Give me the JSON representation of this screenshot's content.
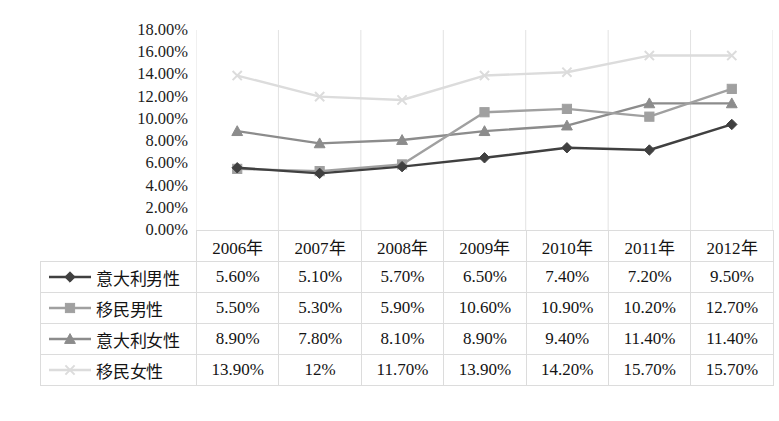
{
  "chart_data": {
    "type": "line",
    "title": "",
    "xlabel": "",
    "ylabel": "",
    "categories": [
      "2006年",
      "2007年",
      "2008年",
      "2009年",
      "2010年",
      "2011年",
      "2012年"
    ],
    "ylim": [
      0,
      18
    ],
    "ytick_step": 2,
    "ytick_labels": [
      "18.00%",
      "16.00%",
      "14.00%",
      "12.00%",
      "10.00%",
      "8.00%",
      "6.00%",
      "4.00%",
      "2.00%",
      "0.00%"
    ],
    "ytick_values": [
      18,
      16,
      14,
      12,
      10,
      8,
      6,
      4,
      2,
      0
    ],
    "grid": "vertical",
    "legend_position": "table-left",
    "series": [
      {
        "name": "意大利男性",
        "marker": "diamond",
        "color": "#404040",
        "values": [
          5.6,
          5.1,
          5.7,
          6.5,
          7.4,
          7.2,
          9.5
        ],
        "labels": [
          "5.60%",
          "5.10%",
          "5.70%",
          "6.50%",
          "7.40%",
          "7.20%",
          "9.50%"
        ]
      },
      {
        "name": "移民男性",
        "marker": "square",
        "color": "#a0a0a0",
        "values": [
          5.5,
          5.3,
          5.9,
          10.6,
          10.9,
          10.2,
          12.7
        ],
        "labels": [
          "5.50%",
          "5.30%",
          "5.90%",
          "10.60%",
          "10.90%",
          "10.20%",
          "12.70%"
        ]
      },
      {
        "name": "意大利女性",
        "marker": "triangle",
        "color": "#8c8c8c",
        "values": [
          8.9,
          7.8,
          8.1,
          8.9,
          9.4,
          11.4,
          11.4
        ],
        "labels": [
          "8.90%",
          "7.80%",
          "8.10%",
          "8.90%",
          "9.40%",
          "11.40%",
          "11.40%"
        ]
      },
      {
        "name": "移民女性",
        "marker": "x",
        "color": "#dcdcdc",
        "values": [
          13.9,
          12.0,
          11.7,
          13.9,
          14.2,
          15.7,
          15.7
        ],
        "labels": [
          "13.90%",
          "12%",
          "11.70%",
          "13.90%",
          "14.20%",
          "15.70%",
          "15.70%"
        ]
      }
    ]
  },
  "table": {
    "corner_label": "",
    "headers": [
      "2006年",
      "2007年",
      "2008年",
      "2009年",
      "2010年",
      "2011年",
      "2012年"
    ],
    "rows": [
      {
        "label": "意大利男性",
        "cells": [
          "5.60%",
          "5.10%",
          "5.70%",
          "6.50%",
          "7.40%",
          "7.20%",
          "9.50%"
        ]
      },
      {
        "label": "移民男性",
        "cells": [
          "5.50%",
          "5.30%",
          "5.90%",
          "10.60%",
          "10.90%",
          "10.20%",
          "12.70%"
        ]
      },
      {
        "label": "意大利女性",
        "cells": [
          "8.90%",
          "7.80%",
          "8.10%",
          "8.90%",
          "9.40%",
          "11.40%",
          "11.40%"
        ]
      },
      {
        "label": "移民女性",
        "cells": [
          "13.90%",
          "12%",
          "11.70%",
          "13.90%",
          "14.20%",
          "15.70%",
          "15.70%"
        ]
      }
    ]
  },
  "style": {
    "gridline_color": "#e2e2e2",
    "table_border_color": "#dcdcdc",
    "background": "#ffffff"
  }
}
